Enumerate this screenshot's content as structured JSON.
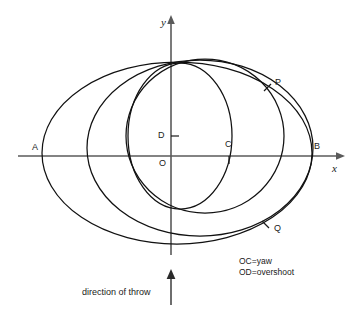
{
  "figure": {
    "type": "geometric-diagram",
    "title": "",
    "background_color": "#ffffff",
    "ink_color": "#1a1a1a",
    "axis_color": "#5a5a5a",
    "curve_color": "#111111"
  },
  "axes": {
    "x_label": "x",
    "y_label": "y",
    "x_axis": {
      "x1": 18,
      "y1": 156,
      "x2": 340,
      "y2": 156
    },
    "y_axis": {
      "x1": 171,
      "y1": 18,
      "x2": 171,
      "y2": 255
    },
    "origin": {
      "x": 171,
      "y": 156
    }
  },
  "points": [
    {
      "name": "A",
      "label": "A",
      "x": 42,
      "y": 156,
      "label_dx": -10,
      "label_dy": -11,
      "tick": false
    },
    {
      "name": "B",
      "label": "B",
      "x": 312,
      "y": 156,
      "label_dx": 4,
      "label_dy": -12,
      "tick": false
    },
    {
      "name": "P",
      "label": "P",
      "x": 268,
      "y": 86,
      "label_dx": 7,
      "label_dy": -11,
      "tick": true
    },
    {
      "name": "Q",
      "label": "Q",
      "x": 266,
      "y": 225,
      "label_dx": 7,
      "label_dy": 1,
      "tick": true
    },
    {
      "name": "O",
      "label": "O",
      "x": 171,
      "y": 156,
      "label_dx": -10,
      "label_dy": 2,
      "tick": false
    },
    {
      "name": "C",
      "label": "C",
      "x": 229,
      "y": 156,
      "label_dx": -3,
      "label_dy": -14,
      "tick": true
    },
    {
      "name": "D",
      "label": "D",
      "x": 171,
      "y": 136,
      "label_dx": -13,
      "label_dy": -5,
      "tick": true
    }
  ],
  "curves": {
    "outer_ellipse": {
      "cx": 177,
      "cy": 153,
      "rx": 135,
      "ry": 91
    },
    "middle_ellipse": {
      "cx": 200,
      "cy": 148,
      "rx": 113,
      "ry": 88
    },
    "large_circle": {
      "cx": 205,
      "cy": 136,
      "rx": 79,
      "ry": 77
    },
    "small_circle": {
      "cx": 180,
      "cy": 136,
      "rx": 52,
      "ry": 73
    }
  },
  "legend": {
    "line1": "OC=yaw",
    "line2": "OD=overshoot"
  },
  "caption": {
    "text": "direction of throw",
    "arrow": "up-arrow"
  }
}
